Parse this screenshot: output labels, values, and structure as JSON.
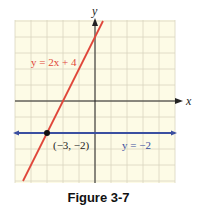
{
  "chart_data": {
    "type": "line",
    "title": "",
    "caption": "Figure 3-7",
    "xlabel": "x",
    "ylabel": "y",
    "xlim": [
      -5,
      5
    ],
    "ylim": [
      -5,
      5
    ],
    "grid": true,
    "grid_step": 1,
    "series": [
      {
        "name": "y = 2x + 4",
        "equation": "y = 2x + 4",
        "slope": 2,
        "intercept": 4,
        "color": "#e0463a",
        "x": [
          -4.5,
          0.5
        ],
        "y": [
          -5,
          5
        ]
      },
      {
        "name": "y = −2",
        "equation": "y = -2",
        "slope": 0,
        "intercept": -2,
        "color": "#3b4fa0",
        "x": [
          -5,
          5
        ],
        "y": [
          -2,
          -2
        ]
      }
    ],
    "annotations": [
      {
        "text": "(−3, −2)",
        "x": -3,
        "y": -2,
        "type": "intersection-point"
      }
    ],
    "colors": {
      "grid_bg": "#fdfbe6",
      "grid_line": "#d9d6bf",
      "axis": "#222222"
    }
  },
  "labels": {
    "x_axis": "x",
    "y_axis": "y",
    "line1": "y = 2x + 4",
    "line2": "y = −2",
    "point": "(−3, −2)",
    "caption": "Figure 3-7"
  }
}
